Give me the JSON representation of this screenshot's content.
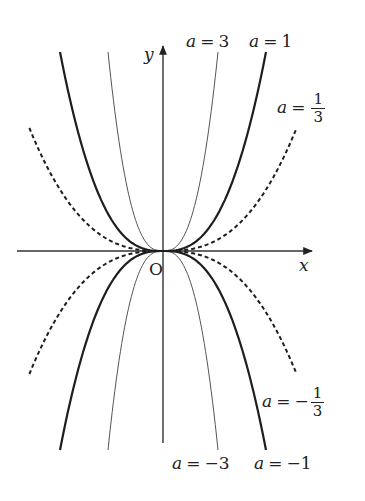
{
  "figure": {
    "origin_label": "O",
    "x_axis_label": "x",
    "y_axis_label": "y",
    "origin_px": [
      163,
      251
    ],
    "x_axis_px": {
      "start": 17,
      "end": 312
    },
    "y_axis_px": {
      "top": 45,
      "bottom": 443
    },
    "stroke_color": "#222222"
  },
  "labels": {
    "a3": {
      "var": "a",
      "eq": "=",
      "val": "3"
    },
    "a1": {
      "var": "a",
      "eq": "=",
      "val": "1"
    },
    "a13": {
      "var": "a",
      "eq": "=",
      "num": "1",
      "den": "3"
    },
    "am13": {
      "var": "a",
      "eq": "=",
      "sign": "−",
      "num": "1",
      "den": "3"
    },
    "am3": {
      "var": "a",
      "eq": "=",
      "val": "−3"
    },
    "am1": {
      "var": "a",
      "eq": "=",
      "val": "−1"
    }
  },
  "chart_data": {
    "type": "line",
    "title": "",
    "xlabel": "x",
    "ylabel": "y",
    "grid": false,
    "series": [
      {
        "name": "a = 3",
        "a": 3,
        "style": "thin",
        "half_width_px": 55,
        "height_px": 199
      },
      {
        "name": "a = 1",
        "a": 1,
        "style": "thick",
        "half_width_px": 103,
        "height_px": 199
      },
      {
        "name": "a = 1/3",
        "a": 0.3333,
        "style": "dashed",
        "half_width_px": 160,
        "height_px": 199,
        "clip_dy_px": 123
      },
      {
        "name": "a = -1/3",
        "a": -0.3333,
        "style": "dashed",
        "half_width_px": 160,
        "height_px": 199,
        "clip_dy_px": 123
      },
      {
        "name": "a = -3",
        "a": -3,
        "style": "thin",
        "half_width_px": 55,
        "height_px": 199
      },
      {
        "name": "a = -1",
        "a": -1,
        "style": "thick",
        "half_width_px": 103,
        "height_px": 199
      }
    ],
    "exponent_visual": 2.67
  }
}
